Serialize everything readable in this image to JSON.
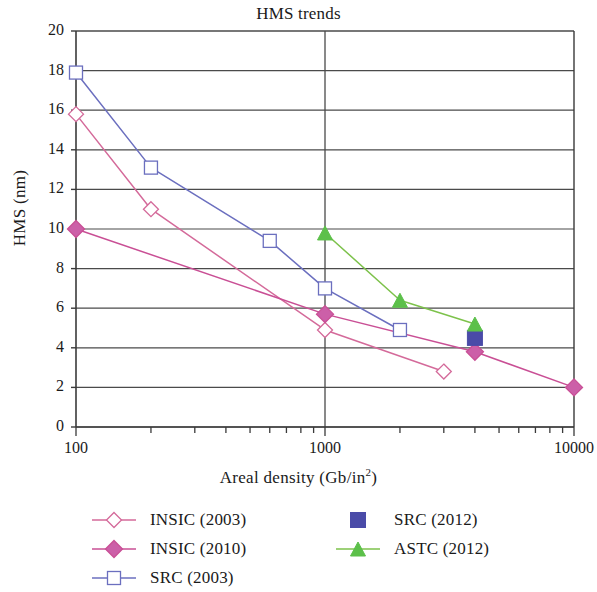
{
  "chart_data": {
    "type": "line",
    "title": "HMS trends",
    "xlabel": "Areal density (Gb/in2)",
    "xlabel_base": "Areal density (Gb/in",
    "xlabel_exponent": "2",
    "xlabel_suffix": ")",
    "ylabel": "HMS (nm)",
    "xscale": "log",
    "xlim": [
      100,
      10000
    ],
    "ylim": [
      0,
      20
    ],
    "xticks": [
      100,
      1000,
      10000
    ],
    "xtick_labels": [
      "100",
      "1000",
      "10000"
    ],
    "yticks": [
      0,
      2,
      4,
      6,
      8,
      10,
      12,
      14,
      16,
      18,
      20
    ],
    "ytick_labels": [
      "0",
      "2",
      "4",
      "6",
      "8",
      "10",
      "12",
      "14",
      "16",
      "18",
      "20"
    ],
    "grid": "horizontal-plus-major-vertical",
    "legend_position": "below-plot-two-columns",
    "series": [
      {
        "name": "INSIC (2003)",
        "color": "#d46a9a",
        "marker": "diamond-open",
        "marker_fill": "#ffffff",
        "x": [
          100,
          200,
          1000,
          3000
        ],
        "y": [
          15.8,
          11.0,
          4.9,
          2.8
        ]
      },
      {
        "name": "INSIC (2010)",
        "color": "#c94f95",
        "marker": "diamond-filled",
        "marker_fill": "#cc5fa8",
        "x": [
          100,
          1000,
          4000,
          10000
        ],
        "y": [
          10.0,
          5.7,
          3.8,
          2.0
        ]
      },
      {
        "name": "SRC (2003)",
        "color": "#6b6fbf",
        "marker": "square-open",
        "marker_fill": "#ffffff",
        "x": [
          100,
          200,
          600,
          1000,
          2000
        ],
        "y": [
          17.9,
          13.1,
          9.4,
          7.0,
          4.9
        ]
      },
      {
        "name": "SRC (2012)",
        "color": "#4a4ba8",
        "marker": "square-filled",
        "marker_fill": "#4a4ba8",
        "x": [
          4000
        ],
        "y": [
          4.5
        ]
      },
      {
        "name": "ASTC (2012)",
        "color": "#7dc24b",
        "marker": "triangle-filled",
        "marker_fill": "#5cc04a",
        "x": [
          1000,
          2000,
          4000
        ],
        "y": [
          9.8,
          6.4,
          5.2
        ]
      }
    ]
  },
  "legend": {
    "columns": [
      {
        "entries": [
          {
            "label": "INSIC (2003)",
            "series": 0
          },
          {
            "label": "INSIC (2010)",
            "series": 1
          },
          {
            "label": "SRC (2003)",
            "series": 2
          }
        ]
      },
      {
        "entries": [
          {
            "label": "SRC (2012)",
            "series": 3
          },
          {
            "label": "ASTC (2012)",
            "series": 4
          }
        ]
      }
    ]
  },
  "colors": {
    "axis": "#3a3a3a",
    "grid": "#4a4a4a",
    "text": "#1a1a1a",
    "background": "#ffffff"
  }
}
